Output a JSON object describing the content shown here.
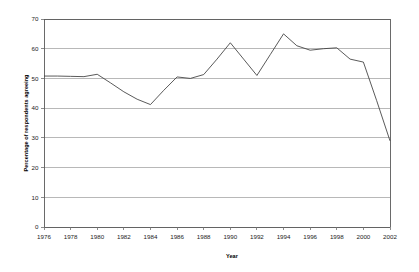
{
  "chart_data": {
    "type": "line",
    "title": "",
    "xlabel": "Year",
    "ylabel": "Percentage of respondents agreeing",
    "ylim": [
      0,
      70
    ],
    "xlim": [
      1976,
      2002
    ],
    "ytick_values": [
      0,
      10,
      20,
      30,
      40,
      50,
      60,
      70
    ],
    "ytick_labels": [
      "0",
      "10",
      "20",
      "30",
      "40",
      "50",
      "60",
      "70"
    ],
    "xtick_values": [
      1976,
      1978,
      1980,
      1982,
      1984,
      1986,
      1988,
      1990,
      1992,
      1994,
      1996,
      1998,
      2000,
      2002
    ],
    "xtick_labels": [
      "1976",
      "1978",
      "1980",
      "1982",
      "1984",
      "1986",
      "1988",
      "1990",
      "1992",
      "1994",
      "1996",
      "1998",
      "2000",
      "2002"
    ],
    "grid": "horizontal",
    "legend": "none",
    "series": [
      {
        "name": "Percentage agreeing",
        "color": "#3c3c3c",
        "x": [
          1976,
          1977,
          1978,
          1979,
          1980,
          1981,
          1982,
          1983,
          1984,
          1985,
          1986,
          1987,
          1988,
          1989,
          1990,
          1991,
          1992,
          1993,
          1994,
          1995,
          1996,
          1997,
          1998,
          1999,
          2000,
          2001,
          2002
        ],
        "values": [
          50.8,
          50.8,
          50.7,
          50.6,
          51.4,
          48.5,
          45.5,
          43.0,
          41.2,
          46.0,
          50.5,
          50.0,
          51.3,
          56.5,
          62.0,
          56.5,
          51.0,
          58.0,
          65.0,
          61.0,
          59.5,
          60.0,
          60.3,
          56.5,
          55.5,
          42.5,
          29.0
        ]
      }
    ]
  }
}
